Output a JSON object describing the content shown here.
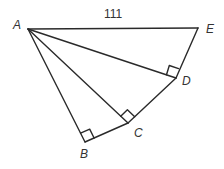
{
  "diagram": {
    "type": "geometry",
    "stroke_color": "#2a2a2a",
    "points": {
      "A": {
        "label": "A",
        "x": 28,
        "y": 29
      },
      "B": {
        "label": "B",
        "x": 85,
        "y": 142
      },
      "C": {
        "label": "C",
        "x": 128,
        "y": 123
      },
      "D": {
        "label": "D",
        "x": 176,
        "y": 78
      },
      "E": {
        "label": "E",
        "x": 198,
        "y": 28
      }
    },
    "segments": [
      {
        "from": "A",
        "to": "E",
        "label": "111"
      },
      {
        "from": "A",
        "to": "B"
      },
      {
        "from": "A",
        "to": "C"
      },
      {
        "from": "A",
        "to": "D"
      },
      {
        "from": "B",
        "to": "C"
      },
      {
        "from": "C",
        "to": "D"
      },
      {
        "from": "D",
        "to": "E"
      }
    ],
    "right_angles": [
      "B",
      "C",
      "D"
    ],
    "length_label": "111"
  }
}
